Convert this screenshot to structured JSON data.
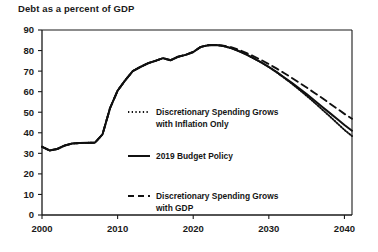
{
  "chart_data": {
    "type": "line",
    "title": "Debt as a percent of GDP",
    "xlabel": "",
    "ylabel": "",
    "xlim": [
      2000,
      2041
    ],
    "ylim": [
      0,
      90
    ],
    "grid": false,
    "legend_position": "inside-center-right",
    "xticks": [
      2000,
      2010,
      2020,
      2030,
      2040
    ],
    "xtick_labels": [
      "2000",
      "2010",
      "2020",
      "2030",
      "2040"
    ],
    "yticks": [
      0,
      10,
      20,
      30,
      40,
      50,
      60,
      70,
      80,
      90
    ],
    "ytick_labels": [
      "0",
      "10",
      "20",
      "30",
      "40",
      "50",
      "60",
      "70",
      "80",
      "90"
    ],
    "x": [
      2000,
      2001,
      2002,
      2003,
      2004,
      2005,
      2006,
      2007,
      2008,
      2009,
      2010,
      2011,
      2012,
      2013,
      2014,
      2015,
      2016,
      2017,
      2018,
      2019,
      2020,
      2021,
      2022,
      2023,
      2024,
      2025,
      2026,
      2027,
      2028,
      2029,
      2030,
      2031,
      2032,
      2033,
      2034,
      2035,
      2036,
      2037,
      2038,
      2039,
      2040,
      2041
    ],
    "series": [
      {
        "name": "2019 Budget Policy",
        "style": "solid",
        "color": "#101010",
        "values": [
          33.2,
          31.4,
          32.1,
          33.8,
          34.8,
          35.0,
          35.1,
          35.2,
          39.2,
          52.0,
          60.5,
          65.5,
          70.0,
          72.0,
          73.8,
          75.0,
          76.3,
          75.3,
          77.0,
          77.9,
          79.3,
          81.8,
          82.6,
          82.7,
          82.2,
          81.2,
          79.8,
          78.1,
          76.2,
          74.2,
          72.0,
          69.6,
          67.0,
          64.4,
          61.6,
          58.8,
          55.8,
          52.8,
          49.8,
          46.8,
          43.8,
          41.0
        ]
      },
      {
        "name": "Discretionary Spending Grows with Inflation Only",
        "style": "dotted",
        "color": "#101010",
        "values": [
          33.2,
          31.4,
          32.1,
          33.8,
          34.8,
          35.0,
          35.1,
          35.2,
          39.2,
          52.0,
          60.5,
          65.5,
          70.0,
          72.0,
          73.8,
          75.0,
          76.3,
          75.3,
          77.0,
          77.9,
          79.3,
          81.8,
          82.6,
          82.7,
          82.2,
          81.2,
          79.8,
          78.1,
          76.2,
          74.2,
          72.0,
          69.5,
          66.8,
          64.0,
          61.0,
          58.0,
          54.8,
          51.5,
          48.2,
          44.8,
          41.4,
          38.4
        ]
      },
      {
        "name": "Discretionary Spending Grows with GDP",
        "style": "dashed",
        "color": "#101010",
        "values": [
          33.2,
          31.4,
          32.1,
          33.8,
          34.8,
          35.0,
          35.1,
          35.2,
          39.2,
          52.0,
          60.5,
          65.5,
          70.0,
          72.0,
          73.8,
          75.0,
          76.3,
          75.3,
          77.0,
          77.9,
          79.3,
          81.8,
          82.6,
          82.8,
          82.4,
          81.6,
          80.4,
          78.9,
          77.2,
          75.4,
          73.4,
          71.3,
          69.1,
          66.8,
          64.4,
          62.0,
          59.5,
          57.0,
          54.4,
          51.8,
          49.2,
          46.8
        ]
      }
    ]
  },
  "legend": {
    "items": [
      {
        "label_line1": "Discretionary Spending Grows",
        "label_line2": "with Inflation Only",
        "style": "dotted"
      },
      {
        "label_line1": "2019 Budget Policy",
        "label_line2": "",
        "style": "solid"
      },
      {
        "label_line1": "Discretionary Spending Grows",
        "label_line2": "with GDP",
        "style": "dashed"
      }
    ]
  }
}
